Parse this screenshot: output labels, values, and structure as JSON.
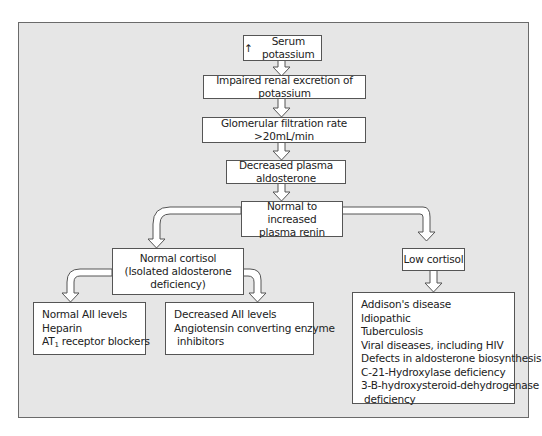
{
  "diagram": {
    "type": "flowchart",
    "nodes": {
      "serum": {
        "arrow_glyph": "↑",
        "label": "Serum potassium"
      },
      "impaired": {
        "label": "Impaired renal excretion of potassium"
      },
      "gfr": {
        "label": "Glomerular filtration rate >20mL/min"
      },
      "aldosterone": {
        "label": "Decreased plasma aldosterone"
      },
      "renin": {
        "line1": "Normal to increased",
        "line2": "plasma renin"
      },
      "normal_cortisol": {
        "line1": "Normal cortisol",
        "line2": "(Isolated aldosterone",
        "line3": "deficiency)"
      },
      "low_cortisol": {
        "label": "Low cortisol"
      },
      "normal_aii": {
        "line1": "Normal AII levels",
        "line2": "Heparin",
        "line3_prefix": "AT",
        "line3_sub": "1",
        "line3_suffix": " receptor blockers"
      },
      "decreased_aii": {
        "line1": "Decreased AII levels",
        "line2": "Angiotensin converting enzyme",
        "line3": "inhibitors"
      },
      "low_cortisol_causes": {
        "items": [
          "Addison's disease",
          "Idiopathic",
          "Tuberculosis",
          "Viral diseases, including HIV",
          "Defects in aldosterone biosynthesis",
          "C-21-Hydroxylase deficiency",
          "3-B-hydroxysteroid-dehydrogenase",
          "deficiency"
        ]
      }
    },
    "edges": [
      [
        "serum",
        "impaired"
      ],
      [
        "impaired",
        "gfr"
      ],
      [
        "gfr",
        "aldosterone"
      ],
      [
        "aldosterone",
        "renin"
      ],
      [
        "renin",
        "normal_cortisol"
      ],
      [
        "renin",
        "low_cortisol"
      ],
      [
        "normal_cortisol",
        "normal_aii"
      ],
      [
        "normal_cortisol",
        "decreased_aii"
      ],
      [
        "low_cortisol",
        "low_cortisol_causes"
      ]
    ],
    "colors": {
      "panel_bg": "#e6e6e6",
      "box_bg": "#ffffff",
      "border": "#555555"
    }
  }
}
